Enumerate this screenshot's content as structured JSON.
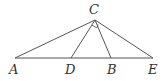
{
  "diagram": {
    "type": "geometry",
    "points": [
      {
        "id": "A",
        "label": "A",
        "x": 15,
        "y": 58
      },
      {
        "id": "D",
        "label": "D",
        "x": 71,
        "y": 58
      },
      {
        "id": "B",
        "label": "B",
        "x": 111,
        "y": 58
      },
      {
        "id": "E",
        "label": "E",
        "x": 153,
        "y": 58
      },
      {
        "id": "C",
        "label": "C",
        "x": 95,
        "y": 20
      }
    ],
    "segments": [
      [
        "A",
        "E"
      ],
      [
        "C",
        "A"
      ],
      [
        "C",
        "D"
      ],
      [
        "C",
        "B"
      ],
      [
        "C",
        "E"
      ]
    ],
    "markings": [
      {
        "type": "right-angle",
        "vertex": "C",
        "between": [
          "D",
          "B"
        ]
      }
    ],
    "labels": {
      "A": "A",
      "D": "D",
      "B": "B",
      "E": "E",
      "C": "C"
    },
    "colors": {
      "line": "#555555",
      "text": "#333333"
    }
  }
}
